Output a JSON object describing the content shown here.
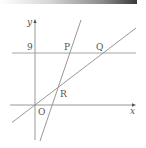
{
  "diagram": {
    "type": "coordinate-geometry",
    "axes": {
      "x_label": "x",
      "y_label": "y",
      "origin_label": "O"
    },
    "horizontal_line": {
      "y_value_label": "9"
    },
    "points": [
      {
        "label": "P",
        "description": "intersection of steep line with y=9"
      },
      {
        "label": "Q",
        "description": "intersection of line through origin with y=9"
      },
      {
        "label": "R",
        "description": "intersection of the two slanted lines"
      },
      {
        "label": "O",
        "description": "origin"
      }
    ],
    "colors": {
      "line": "#8c8c8c",
      "text": "#555555",
      "top_bar_dark": "#3a3a3a"
    }
  }
}
